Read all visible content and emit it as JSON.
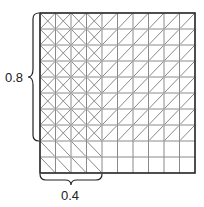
{
  "diagram": {
    "type": "area-model-multiplication",
    "grid": {
      "rows": 10,
      "cols": 10
    },
    "shaded_rows": 8,
    "shaded_cols": 4,
    "row_pattern": "forward-slash",
    "col_pattern": "back-slash",
    "overlap_pattern": "cross",
    "labels": {
      "vertical": "0.8",
      "horizontal": "0.4"
    },
    "colors": {
      "border": "#222222",
      "grid_line": "#8a8a8a",
      "hatch": "#8a8a8a",
      "label": "#222222"
    }
  }
}
